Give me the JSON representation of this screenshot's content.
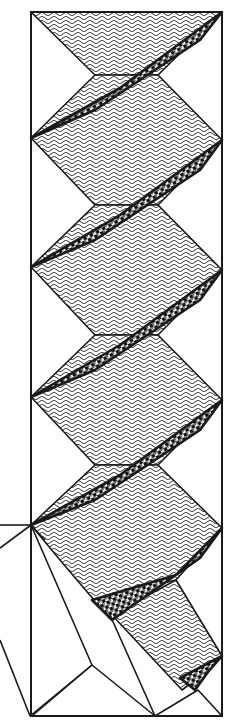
{
  "figure": {
    "width": 234,
    "height": 723,
    "colors": {
      "ink": "#1a1a1a",
      "paper": "#ffffff"
    },
    "frame": {
      "x1": 31,
      "y1": 12,
      "x2": 222,
      "y2": 716
    },
    "herringbone_panels": [
      [
        [
          31,
          12
        ],
        [
          222,
          12
        ],
        [
          158,
          75
        ],
        [
          95,
          75
        ]
      ],
      [
        [
          31,
          138
        ],
        [
          95,
          75
        ],
        [
          158,
          75
        ],
        [
          222,
          140
        ],
        [
          158,
          205
        ],
        [
          95,
          205
        ]
      ],
      [
        [
          31,
          267
        ],
        [
          95,
          205
        ],
        [
          158,
          205
        ],
        [
          222,
          270
        ],
        [
          158,
          335
        ],
        [
          95,
          335
        ]
      ],
      [
        [
          31,
          397
        ],
        [
          95,
          335
        ],
        [
          158,
          335
        ],
        [
          222,
          400
        ],
        [
          158,
          465
        ],
        [
          95,
          465
        ]
      ],
      [
        [
          31,
          525
        ],
        [
          95,
          465
        ],
        [
          158,
          465
        ],
        [
          222,
          528
        ],
        [
          176,
          580
        ],
        [
          94,
          600
        ],
        [
          60,
          560
        ]
      ],
      [
        [
          112,
          615
        ],
        [
          176,
          580
        ],
        [
          222,
          656
        ],
        [
          195,
          680
        ],
        [
          182,
          690
        ]
      ]
    ],
    "houndstooth_bands": [
      [
        [
          31,
          138
        ],
        [
          120,
          88
        ],
        [
          222,
          12
        ],
        [
          200,
          40
        ],
        [
          95,
          110
        ]
      ],
      [
        [
          31,
          267
        ],
        [
          120,
          215
        ],
        [
          222,
          140
        ],
        [
          200,
          170
        ],
        [
          95,
          240
        ]
      ],
      [
        [
          31,
          397
        ],
        [
          120,
          345
        ],
        [
          222,
          270
        ],
        [
          200,
          300
        ],
        [
          95,
          370
        ]
      ],
      [
        [
          31,
          525
        ],
        [
          120,
          475
        ],
        [
          222,
          400
        ],
        [
          200,
          430
        ],
        [
          95,
          500
        ]
      ],
      [
        [
          92,
          600
        ],
        [
          176,
          575
        ],
        [
          222,
          528
        ],
        [
          200,
          558
        ],
        [
          112,
          620
        ]
      ],
      [
        [
          180,
          678
        ],
        [
          222,
          656
        ],
        [
          208,
          672
        ],
        [
          195,
          690
        ]
      ]
    ],
    "outline_lines": [
      [
        [
          0,
          525
        ],
        [
          31,
          525
        ]
      ],
      [
        [
          31,
          525
        ],
        [
          0,
          548
        ]
      ],
      [
        [
          31,
          525
        ],
        [
          92,
          665
        ]
      ],
      [
        [
          92,
          665
        ],
        [
          30,
          716
        ]
      ],
      [
        [
          0,
          640
        ],
        [
          30,
          716
        ]
      ],
      [
        [
          92,
          665
        ],
        [
          155,
          716
        ]
      ],
      [
        [
          31,
          525
        ],
        [
          45,
          540
        ]
      ],
      [
        [
          110,
          615
        ],
        [
          155,
          716
        ]
      ],
      [
        [
          92,
          665
        ],
        [
          32,
          716
        ]
      ],
      [
        [
          155,
          716
        ],
        [
          198,
          690
        ]
      ],
      [
        [
          198,
          690
        ],
        [
          222,
          716
        ]
      ]
    ]
  }
}
